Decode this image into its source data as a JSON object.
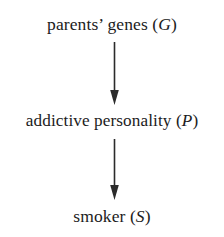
{
  "diagram": {
    "type": "causal-chain",
    "orientation": "vertical-top-down",
    "background_color": "#ffffff",
    "text_color": "#1c1c1c",
    "arrow_color": "#2b2b2b",
    "nodes": [
      {
        "id": "genes",
        "text_plain": "parents’ genes (G)",
        "label": "parents’ genes (",
        "variable": "G",
        "label_suffix": ")"
      },
      {
        "id": "personality",
        "text_plain": "addictive personality (P)",
        "label": "addictive personality (",
        "variable": "P",
        "label_suffix": ")"
      },
      {
        "id": "smoker",
        "text_plain": "smoker (S)",
        "label": "smoker (",
        "variable": "S",
        "label_suffix": ")"
      }
    ],
    "edges": [
      {
        "id": "genes-to-personality",
        "from": "genes",
        "to": "personality",
        "style": "solid-arrow"
      },
      {
        "id": "personality-to-smoker",
        "from": "personality",
        "to": "smoker",
        "style": "solid-arrow"
      }
    ]
  }
}
